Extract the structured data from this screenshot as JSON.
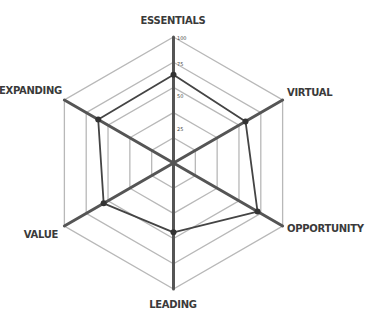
{
  "chart_data": {
    "type": "radar",
    "title": "",
    "axes": [
      "ESSENTIALS",
      "VIRTUAL",
      "OPPORTUNITY",
      "LEADING",
      "VALUE",
      "EXPANDING"
    ],
    "series": [
      {
        "name": "",
        "values": [
          70,
          66,
          77,
          55,
          64,
          69
        ]
      }
    ],
    "radial_ticks": [
      "25",
      "50",
      "75",
      "100"
    ],
    "rlim": [
      0,
      100
    ],
    "grid_rings": 5,
    "grid": true,
    "legend": "none",
    "colors": {
      "axis": "#555555",
      "grid": "#b8b8b8",
      "series": "#444444",
      "point": "#333333"
    }
  }
}
